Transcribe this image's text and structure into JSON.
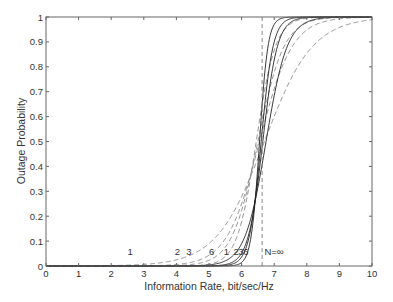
{
  "chart_data": {
    "type": "line",
    "title": "",
    "xlabel": "Information Rate, bit/sec/Hz",
    "ylabel": "Outage Probability",
    "xlim": [
      0,
      10
    ],
    "ylim": [
      0,
      1
    ],
    "xticks": [
      "0",
      "1",
      "2",
      "3",
      "4",
      "5",
      "6",
      "7",
      "8",
      "9",
      "10"
    ],
    "yticks": [
      "0",
      "0.1",
      "0.2",
      "0.3",
      "0.4",
      "0.5",
      "0.6",
      "0.7",
      "0.8",
      "0.9",
      "1"
    ],
    "grid": false,
    "legend": "none (inline curve labels)",
    "series": [
      {
        "name": "1 (dashed)",
        "style": "dashed",
        "center": 6.7,
        "spread": 1.25,
        "label_text": "1",
        "label_x": 2.5,
        "label_y": 0.055
      },
      {
        "name": "2 (dashed)",
        "style": "dashed",
        "center": 6.55,
        "spread": 0.85,
        "label_text": "2",
        "label_x": 3.95,
        "label_y": 0.055
      },
      {
        "name": "3 (dashed)",
        "style": "dashed",
        "center": 6.5,
        "spread": 0.68,
        "label_text": "3",
        "label_x": 4.3,
        "label_y": 0.055
      },
      {
        "name": "6 (dashed)",
        "style": "dashed",
        "center": 6.45,
        "spread": 0.5,
        "label_text": "6",
        "label_x": 5.0,
        "label_y": 0.055
      },
      {
        "name": "1 (solid)",
        "style": "solid",
        "center": 6.75,
        "spread": 0.55,
        "label_text": "1",
        "label_x": 5.45,
        "label_y": 0.055
      },
      {
        "name": "2 (solid)",
        "style": "solid",
        "center": 6.65,
        "spread": 0.38,
        "label_text": "2",
        "label_x": 5.75,
        "label_y": 0.055
      },
      {
        "name": "3 (solid)",
        "style": "solid",
        "center": 6.6,
        "spread": 0.31,
        "label_text": "3",
        "label_x": 5.9,
        "label_y": 0.055
      },
      {
        "name": "6 (solid)",
        "style": "solid",
        "center": 6.55,
        "spread": 0.22,
        "label_text": "6",
        "label_x": 6.05,
        "label_y": 0.055
      },
      {
        "name": "N=∞",
        "style": "dashed-step",
        "step_x": 6.63,
        "label_text": "N=∞",
        "label_x": 6.7,
        "label_y": 0.055
      }
    ]
  }
}
